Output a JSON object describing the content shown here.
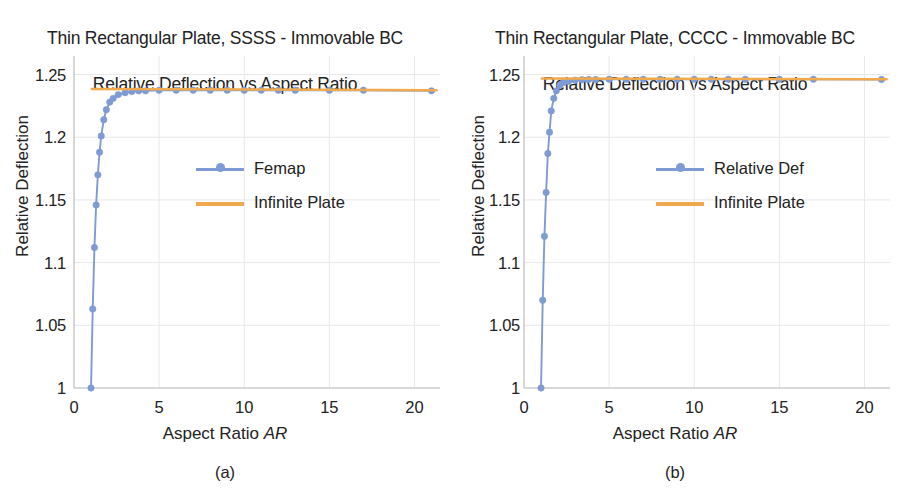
{
  "figure": {
    "width": 901,
    "height": 499,
    "background": "#ffffff"
  },
  "colors": {
    "series_blue": "#7e9bd6",
    "series_blue_line": "#7b97d4",
    "infinite_orange": "#f0a94c",
    "text": "#222222",
    "grid": "#e8e8e8",
    "axis": "#d0d0d0"
  },
  "panels": [
    {
      "id": "a",
      "caption": "(a)",
      "title_line1": "Thin Rectangular Plate, SSSS - Immovable BC",
      "title_line2": "Relative Deflection vs Aspect Ratio",
      "xlabel_text": "Aspect Ratio ",
      "xlabel_italic": "AR",
      "ylabel": "Relative Deflection",
      "yticks": [
        "1",
        "1.05",
        "1.1",
        "1.15",
        "1.2",
        "1.25"
      ],
      "xticks": [
        "0",
        "5",
        "10",
        "15",
        "20"
      ],
      "legend": [
        {
          "label": "Femap",
          "style": "line-marker",
          "color": "#7e9bd6"
        },
        {
          "label": "Infinite Plate",
          "style": "line",
          "color": "#f0a94c"
        }
      ]
    },
    {
      "id": "b",
      "caption": "(b)",
      "title_line1": "Thin Rectangular Plate, CCCC - Immovable BC",
      "title_line2": "Relative Deflection vs Aspect Ratio",
      "xlabel_text": "Aspect Ratio ",
      "xlabel_italic": "AR",
      "ylabel": "Relative Deflection",
      "yticks": [
        "1",
        "1.05",
        "1.1",
        "1.15",
        "1.2",
        "1.25"
      ],
      "xticks": [
        "0",
        "5",
        "10",
        "15",
        "20"
      ],
      "legend": [
        {
          "label": "Relative Def",
          "style": "line-marker",
          "color": "#7e9bd6"
        },
        {
          "label": "Infinite Plate",
          "style": "line",
          "color": "#f0a94c"
        }
      ]
    }
  ],
  "chart_data": [
    {
      "type": "line",
      "panel": "a",
      "title": "Thin Rectangular Plate, SSSS - Immovable BC — Relative Deflection vs Aspect Ratio",
      "xlabel": "Aspect Ratio AR",
      "ylabel": "Relative Deflection",
      "xlim": [
        0,
        21.5
      ],
      "ylim": [
        1.0,
        1.26
      ],
      "xticks": [
        0,
        5,
        10,
        15,
        20
      ],
      "yticks": [
        1,
        1.05,
        1.1,
        1.15,
        1.2,
        1.25
      ],
      "grid": true,
      "legend_position": "center",
      "series": [
        {
          "name": "Femap",
          "color": "#7e9bd6",
          "markers": true,
          "x": [
            1.0,
            1.1,
            1.2,
            1.3,
            1.4,
            1.5,
            1.6,
            1.75,
            1.9,
            2.1,
            2.3,
            2.6,
            3.0,
            3.4,
            3.8,
            4.2,
            5.0,
            6.0,
            7.0,
            8.0,
            9.0,
            10.0,
            11.0,
            12.0,
            13.0,
            15.0,
            17.0,
            21.0
          ],
          "y": [
            1.0,
            1.063,
            1.112,
            1.146,
            1.17,
            1.188,
            1.201,
            1.214,
            1.222,
            1.228,
            1.231,
            1.234,
            1.2355,
            1.2365,
            1.237,
            1.237,
            1.2375,
            1.2375,
            1.2375,
            1.2375,
            1.2375,
            1.2375,
            1.2375,
            1.2375,
            1.2375,
            1.2375,
            1.2375,
            1.237
          ]
        },
        {
          "name": "Infinite Plate",
          "color": "#f0a94c",
          "markers": false,
          "x": [
            1.05,
            21.3
          ],
          "y": [
            1.2385,
            1.2375
          ]
        }
      ]
    },
    {
      "type": "line",
      "panel": "b",
      "title": "Thin Rectangular Plate, CCCC - Immovable BC — Relative Deflection vs Aspect Ratio",
      "xlabel": "Aspect Ratio AR",
      "ylabel": "Relative Deflection",
      "xlim": [
        0,
        21.5
      ],
      "ylim": [
        1.0,
        1.26
      ],
      "xticks": [
        0,
        5,
        10,
        15,
        20
      ],
      "yticks": [
        1,
        1.05,
        1.1,
        1.15,
        1.2,
        1.25
      ],
      "grid": true,
      "legend_position": "center",
      "series": [
        {
          "name": "Relative Def",
          "color": "#7e9bd6",
          "markers": true,
          "x": [
            1.0,
            1.1,
            1.2,
            1.3,
            1.4,
            1.5,
            1.6,
            1.75,
            1.9,
            2.1,
            2.3,
            2.6,
            3.0,
            3.4,
            3.8,
            4.2,
            5.0,
            6.0,
            7.0,
            8.0,
            9.0,
            10.0,
            11.0,
            12.0,
            13.0,
            15.0,
            17.0,
            21.0
          ],
          "y": [
            1.0,
            1.07,
            1.121,
            1.156,
            1.187,
            1.204,
            1.221,
            1.231,
            1.237,
            1.2415,
            1.2435,
            1.2445,
            1.2455,
            1.2458,
            1.246,
            1.246,
            1.2462,
            1.2462,
            1.2462,
            1.2462,
            1.2462,
            1.2462,
            1.2462,
            1.2462,
            1.2462,
            1.2462,
            1.2462,
            1.246
          ]
        },
        {
          "name": "Infinite Plate",
          "color": "#f0a94c",
          "markers": false,
          "x": [
            1.05,
            21.3
          ],
          "y": [
            1.2468,
            1.2462
          ]
        }
      ]
    }
  ]
}
